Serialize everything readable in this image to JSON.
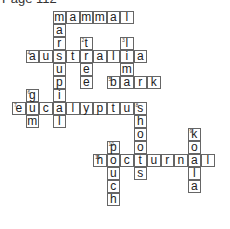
{
  "page": {
    "title": "Page 112"
  },
  "crossword": {
    "cell_size": 13.5,
    "cells": [
      {
        "r": 0,
        "c": 3,
        "l": "m"
      },
      {
        "r": 0,
        "c": 4,
        "l": "a"
      },
      {
        "r": 0,
        "c": 5,
        "l": "m"
      },
      {
        "r": 0,
        "c": 6,
        "l": "m"
      },
      {
        "r": 0,
        "c": 7,
        "l": "a"
      },
      {
        "r": 0,
        "c": 8,
        "l": "l"
      },
      {
        "r": 1,
        "c": 3,
        "l": "a"
      },
      {
        "r": 2,
        "c": 3,
        "l": "r"
      },
      {
        "r": 2,
        "c": 5,
        "l": "t",
        "n": "2"
      },
      {
        "r": 2,
        "c": 8,
        "l": "l",
        "n": "3"
      },
      {
        "r": 3,
        "c": 1,
        "l": "a",
        "n": "4"
      },
      {
        "r": 3,
        "c": 2,
        "l": "u"
      },
      {
        "r": 3,
        "c": 3,
        "l": "s"
      },
      {
        "r": 3,
        "c": 4,
        "l": "t"
      },
      {
        "r": 3,
        "c": 5,
        "l": "r"
      },
      {
        "r": 3,
        "c": 6,
        "l": "a"
      },
      {
        "r": 3,
        "c": 7,
        "l": "l"
      },
      {
        "r": 3,
        "c": 8,
        "l": "i"
      },
      {
        "r": 3,
        "c": 9,
        "l": "a"
      },
      {
        "r": 4,
        "c": 3,
        "l": "u"
      },
      {
        "r": 4,
        "c": 5,
        "l": "e"
      },
      {
        "r": 4,
        "c": 8,
        "l": "m"
      },
      {
        "r": 5,
        "c": 3,
        "l": "p"
      },
      {
        "r": 5,
        "c": 5,
        "l": "e"
      },
      {
        "r": 5,
        "c": 7,
        "l": "b",
        "n": "5"
      },
      {
        "r": 5,
        "c": 8,
        "l": "a"
      },
      {
        "r": 5,
        "c": 9,
        "l": "r"
      },
      {
        "r": 5,
        "c": 10,
        "l": "k"
      },
      {
        "r": 6,
        "c": 1,
        "l": "g",
        "n": "6"
      },
      {
        "r": 6,
        "c": 3,
        "l": "i"
      },
      {
        "r": 7,
        "c": 0,
        "l": "e",
        "n": "7"
      },
      {
        "r": 7,
        "c": 1,
        "l": "u"
      },
      {
        "r": 7,
        "c": 2,
        "l": "c"
      },
      {
        "r": 7,
        "c": 3,
        "l": "a"
      },
      {
        "r": 7,
        "c": 4,
        "l": "l"
      },
      {
        "r": 7,
        "c": 5,
        "l": "y"
      },
      {
        "r": 7,
        "c": 6,
        "l": "p"
      },
      {
        "r": 7,
        "c": 7,
        "l": "t"
      },
      {
        "r": 7,
        "c": 8,
        "l": "u"
      },
      {
        "r": 7,
        "c": 9,
        "l": "s",
        "n": "8"
      },
      {
        "r": 8,
        "c": 1,
        "l": "m"
      },
      {
        "r": 8,
        "c": 3,
        "l": "l"
      },
      {
        "r": 8,
        "c": 9,
        "l": "h"
      },
      {
        "r": 9,
        "c": 9,
        "l": "o"
      },
      {
        "r": 9,
        "c": 13,
        "l": "k",
        "n": "9"
      },
      {
        "r": 10,
        "c": 7,
        "l": "p",
        "n": "10"
      },
      {
        "r": 10,
        "c": 9,
        "l": "o"
      },
      {
        "r": 10,
        "c": 13,
        "l": "o"
      },
      {
        "r": 11,
        "c": 6,
        "l": "h",
        "n": "11"
      },
      {
        "r": 11,
        "c": 7,
        "l": "o"
      },
      {
        "r": 11,
        "c": 8,
        "l": "c"
      },
      {
        "r": 11,
        "c": 9,
        "l": "t"
      },
      {
        "r": 11,
        "c": 10,
        "l": "u"
      },
      {
        "r": 11,
        "c": 11,
        "l": "r"
      },
      {
        "r": 11,
        "c": 12,
        "l": "n"
      },
      {
        "r": 11,
        "c": 13,
        "l": "a"
      },
      {
        "r": 11,
        "c": 14,
        "l": "l"
      },
      {
        "r": 12,
        "c": 7,
        "l": "u"
      },
      {
        "r": 12,
        "c": 9,
        "l": "s"
      },
      {
        "r": 12,
        "c": 13,
        "l": "l"
      },
      {
        "r": 13,
        "c": 7,
        "l": "c"
      },
      {
        "r": 13,
        "c": 13,
        "l": "a"
      },
      {
        "r": 14,
        "c": 7,
        "l": "h"
      }
    ],
    "words": [
      {
        "number": "1",
        "direction": "across",
        "answer": "mammal"
      },
      {
        "number": "1",
        "direction": "down",
        "answer": "marsupial"
      },
      {
        "number": "2",
        "direction": "down",
        "answer": "tree"
      },
      {
        "number": "3",
        "direction": "down",
        "answer": "lima"
      },
      {
        "number": "4",
        "direction": "across",
        "answer": "australia"
      },
      {
        "number": "5",
        "direction": "across",
        "answer": "bark"
      },
      {
        "number": "6",
        "direction": "down",
        "answer": "gum"
      },
      {
        "number": "7",
        "direction": "across",
        "answer": "eucalyptus"
      },
      {
        "number": "8",
        "direction": "down",
        "answer": "shoots"
      },
      {
        "number": "9",
        "direction": "down",
        "answer": "koala"
      },
      {
        "number": "10",
        "direction": "down",
        "answer": "pouch"
      },
      {
        "number": "11",
        "direction": "across",
        "answer": "hocturnal"
      }
    ]
  }
}
